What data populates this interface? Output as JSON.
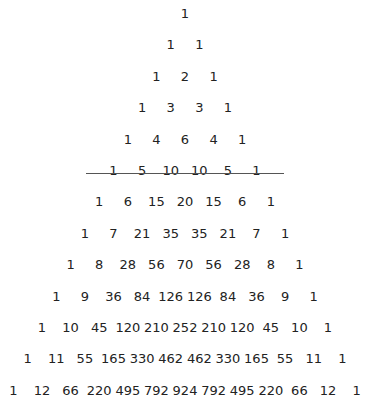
{
  "rows": [
    [
      1
    ],
    [
      1,
      1
    ],
    [
      1,
      2,
      1
    ],
    [
      1,
      3,
      3,
      1
    ],
    [
      1,
      4,
      6,
      4,
      1
    ],
    [
      1,
      5,
      10,
      10,
      5,
      1
    ],
    [
      1,
      6,
      15,
      20,
      15,
      6,
      1
    ],
    [
      1,
      7,
      21,
      35,
      35,
      21,
      7,
      1
    ],
    [
      1,
      8,
      28,
      56,
      70,
      56,
      28,
      8,
      1
    ],
    [
      1,
      9,
      36,
      84,
      126,
      126,
      84,
      36,
      9,
      1
    ],
    [
      1,
      10,
      45,
      120,
      210,
      252,
      210,
      120,
      45,
      10,
      1
    ],
    [
      1,
      11,
      55,
      165,
      330,
      462,
      462,
      330,
      165,
      55,
      11,
      1
    ],
    [
      1,
      12,
      66,
      220,
      495,
      792,
      924,
      792,
      495,
      220,
      66,
      12,
      1
    ]
  ],
  "underlined_row_index": 6
}
